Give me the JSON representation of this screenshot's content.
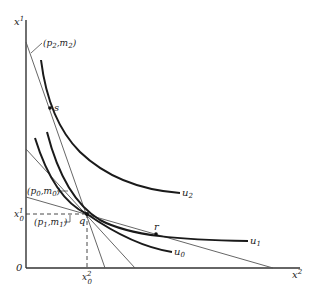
{
  "diagram": {
    "axes": {
      "y_label": "x",
      "y_label_sup": "1",
      "x_label": "x",
      "x_label_sup": "2",
      "origin_label": "0"
    },
    "points": {
      "s": "s",
      "q": "q",
      "r": "r"
    },
    "curves": {
      "u0": {
        "base": "u",
        "sub": "0"
      },
      "u1": {
        "base": "u",
        "sub": "1"
      },
      "u2": {
        "base": "u",
        "sub": "2"
      }
    },
    "budget_lines": {
      "p2m2": {
        "open": "(p",
        "p_sub": "2",
        "comma": ",m",
        "m_sub": "2",
        "close": ")"
      },
      "p0m0": {
        "open": "(p",
        "p_sub": "0",
        "comma": ",m",
        "m_sub": "0",
        "close": ")"
      },
      "p1m1": {
        "open": "(p",
        "p_sub": "1",
        "comma": ",m",
        "m_sub": "1",
        "close": ")"
      }
    },
    "ticks": {
      "x0_1": {
        "base": "x",
        "sup": "1",
        "sub": "0"
      },
      "x0_2": {
        "base": "x",
        "sup": "2",
        "sub": "0"
      }
    },
    "colors": {
      "axis": "#333333",
      "curve": "#1a1a1a",
      "line": "#555555"
    }
  }
}
